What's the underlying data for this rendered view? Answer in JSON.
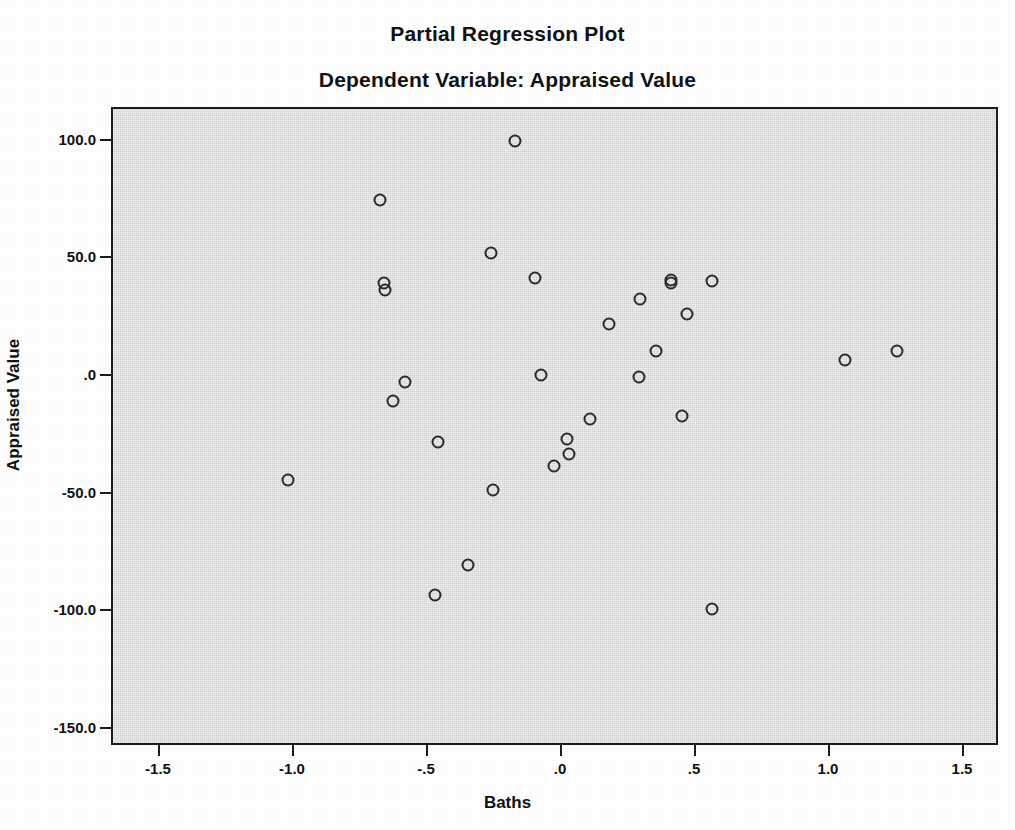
{
  "titles": {
    "main": "Partial Regression Plot",
    "sub": "Dependent Variable: Appraised Value"
  },
  "axes": {
    "x_title": "Baths",
    "y_title": "Appraised Value"
  },
  "colors": {
    "plot_background": "#dcdcdc",
    "frame": "#1c1c1c",
    "marker_stroke": "#2b2b2b",
    "page_background": "#ffffff",
    "text": "#111111"
  },
  "chart_data": {
    "type": "scatter",
    "title": "Partial Regression Plot",
    "subtitle": "Dependent Variable: Appraised Value",
    "xlabel": "Baths",
    "ylabel": "Appraised Value",
    "xlim": [
      -1.72,
      1.63
    ],
    "ylim": [
      -163.0,
      113.6
    ],
    "grid": false,
    "legend": null,
    "marker": "open-circle",
    "xticks": [
      -1.5,
      -1.0,
      -0.5,
      0.0,
      0.5,
      1.0,
      1.5
    ],
    "xticklabels": [
      "-1.5",
      "-1.0",
      "-.5",
      ".0",
      ".5",
      "1.0",
      "1.5"
    ],
    "yticks": [
      100.0,
      50.0,
      0.0,
      -50.0,
      -100.0,
      -150.0
    ],
    "yticklabels": [
      "100.0",
      "50.0",
      ".0",
      "-50.0",
      "-100.0",
      "-150.0"
    ],
    "points": [
      {
        "x": -1.022,
        "y": -44.3
      },
      {
        "x": -0.679,
        "y": 74.9
      },
      {
        "x": -0.664,
        "y": 39.6
      },
      {
        "x": -0.66,
        "y": 36.6
      },
      {
        "x": -0.631,
        "y": -10.6
      },
      {
        "x": -0.586,
        "y": -2.6
      },
      {
        "x": -0.463,
        "y": -28.1
      },
      {
        "x": -0.474,
        "y": -93.2
      },
      {
        "x": -0.351,
        "y": -80.4
      },
      {
        "x": -0.265,
        "y": 52.3
      },
      {
        "x": -0.257,
        "y": -48.5
      },
      {
        "x": -0.175,
        "y": 100.0
      },
      {
        "x": -0.101,
        "y": 41.7
      },
      {
        "x": -0.078,
        "y": 0.4
      },
      {
        "x": -0.03,
        "y": -38.3
      },
      {
        "x": 0.019,
        "y": -26.8
      },
      {
        "x": 0.026,
        "y": -33.2
      },
      {
        "x": 0.104,
        "y": -18.3
      },
      {
        "x": 0.175,
        "y": 22.1
      },
      {
        "x": 0.291,
        "y": 32.8
      },
      {
        "x": 0.287,
        "y": -0.4
      },
      {
        "x": 0.351,
        "y": 10.6
      },
      {
        "x": 0.407,
        "y": 39.6
      },
      {
        "x": 0.407,
        "y": 40.9
      },
      {
        "x": 0.448,
        "y": -17.0
      },
      {
        "x": 0.466,
        "y": 26.4
      },
      {
        "x": 0.56,
        "y": 40.4
      },
      {
        "x": 0.56,
        "y": -99.1
      },
      {
        "x": 1.056,
        "y": 6.8
      },
      {
        "x": 1.25,
        "y": 10.6
      }
    ]
  }
}
